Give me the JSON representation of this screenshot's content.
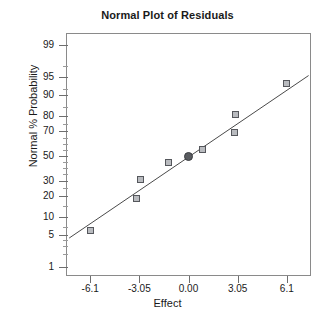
{
  "chart_data": {
    "type": "scatter",
    "title": "Normal Plot of Residuals",
    "xlabel": "Effect",
    "ylabel": "Normal % Probability",
    "grid": false,
    "legend": null,
    "xlim": [
      -7.6,
      7.6
    ],
    "ylim": [
      0.6,
      99.5
    ],
    "yscale": "probit",
    "x_ticks": [
      -6.1,
      -3.05,
      0.0,
      3.05,
      6.1
    ],
    "x_tick_labels": [
      "-6.1",
      "-3.05",
      "0.00",
      "3.05",
      "6.1"
    ],
    "y_ticks": [
      1,
      5,
      10,
      20,
      30,
      50,
      70,
      80,
      90,
      95,
      99
    ],
    "y_tick_labels": [
      "1",
      "5",
      "10",
      "20",
      "30",
      "50",
      "70",
      "80",
      "90",
      "95",
      "99"
    ],
    "y_minor_ticks": [
      2,
      3,
      4,
      7,
      15,
      25,
      35,
      40,
      45,
      55,
      60,
      65,
      75,
      85,
      92,
      97
    ],
    "series": [
      {
        "name": "Residual points",
        "marker": "square",
        "color": "#b9bbbf",
        "edge_color": "#55575c",
        "points": [
          {
            "x": -6.05,
            "y": 6.0,
            "label": "-6.05, 6%"
          },
          {
            "x": -3.2,
            "y": 18.5,
            "label": "-3.2, 18.5%"
          },
          {
            "x": -2.95,
            "y": 31.0,
            "label": "-2.95, 31%"
          },
          {
            "x": -1.25,
            "y": 44.5,
            "label": "-1.25, 44.5%"
          },
          {
            "x": 0.85,
            "y": 55.5,
            "label": "0.85, 55.5%"
          },
          {
            "x": 2.85,
            "y": 69.0,
            "label": "2.85, 69%"
          },
          {
            "x": 2.9,
            "y": 81.0,
            "label": "2.9, 81%"
          },
          {
            "x": 6.05,
            "y": 93.5,
            "label": "6.05, 93.5%"
          }
        ]
      },
      {
        "name": "Highlighted point",
        "marker": "circle",
        "color": "#5a5c60",
        "edge_color": "#3a3c40",
        "points": [
          {
            "x": 0.0,
            "y": 50.0,
            "label": "0.00, 50%"
          }
        ]
      }
    ],
    "reference_line": {
      "name": "Normal reference line",
      "color": "#4a4a4a",
      "start": {
        "x": -7.4,
        "y": 4.3
      },
      "end": {
        "x": 7.45,
        "y": 95.4
      }
    }
  }
}
